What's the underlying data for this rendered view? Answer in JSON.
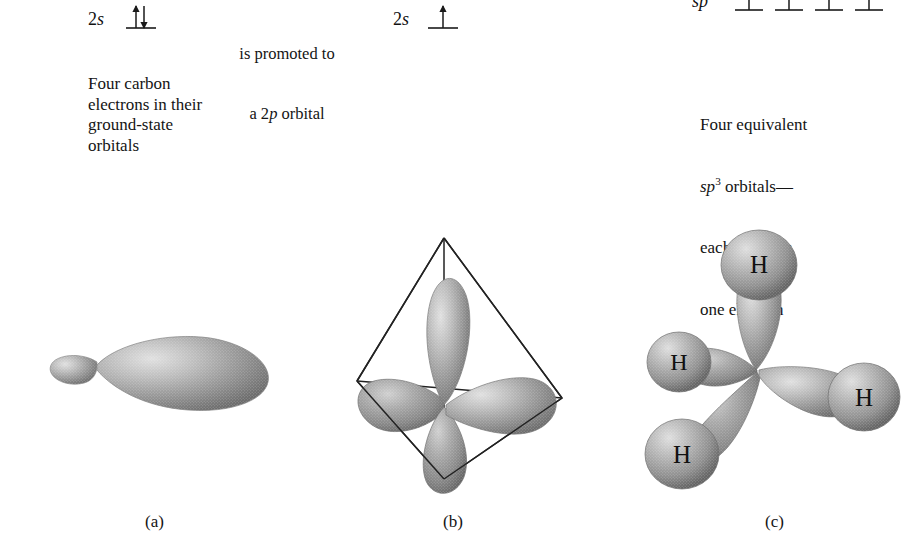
{
  "figure": {
    "background_color": "#ffffff",
    "width": 923,
    "height": 556
  },
  "orbital_diagrams": {
    "ground_state": {
      "label_prefix": "2",
      "label_orbital": "s",
      "electrons": "paired",
      "arrow_up": "↑",
      "arrow_down": "↓"
    },
    "excited_state": {
      "label_prefix": "2",
      "label_orbital": "s",
      "electrons": "single",
      "arrow_up": "↑"
    },
    "hybrid_state": {
      "label_prefix": "",
      "label_orbital": "sp",
      "label_superscript": "3",
      "orbital_count": 4,
      "electrons_each": 1,
      "arrow_up": "↑"
    }
  },
  "annotations": {
    "left_caption": "Four carbon\nelectrons in their\nground-state\norbitals",
    "middle_caption_line1": "is promoted to",
    "middle_caption_line2_pre": "a 2",
    "middle_caption_line2_ital": "p",
    "middle_caption_line2_post": " orbital",
    "right_caption_line1": "Four equivalent",
    "right_caption_line2_ital": "sp",
    "right_caption_line2_sup": "3",
    "right_caption_line2_post": " orbitals—",
    "right_caption_line3": "each contains",
    "right_caption_line4": "one electron"
  },
  "panels": [
    {
      "id": "a",
      "caption": "(a)",
      "description": "single sp3 hybrid orbital with small back lobe and large front lobe",
      "lobes": 1
    },
    {
      "id": "b",
      "caption": "(b)",
      "description": "four sp3 orbitals in tetrahedral arrangement inside wireframe tetrahedron",
      "lobes": 4,
      "tetrahedron": true
    },
    {
      "id": "c",
      "caption": "(c)",
      "description": "methane molecule, four sp3 orbitals each overlapping a hydrogen 1s orbital",
      "lobes": 4,
      "hydrogen_labels": [
        "H",
        "H",
        "H",
        "H"
      ]
    }
  ],
  "colors": {
    "orbital_dark": "#6e6e6e",
    "orbital_mid": "#9a9a9a",
    "orbital_light": "#d2d2d2",
    "outline": "#2b2b2b",
    "text": "#141414"
  }
}
